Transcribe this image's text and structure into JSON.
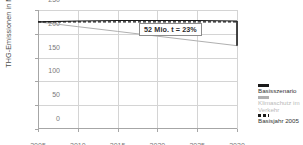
{
  "chart_data": {
    "type": "line",
    "title": "",
    "xlabel": "",
    "ylabel": "THG-Emissionen in Mio. t/a",
    "xlim": [
      2005,
      2030
    ],
    "ylim": [
      0,
      250
    ],
    "yticks": [
      0,
      50,
      100,
      150,
      200,
      250
    ],
    "xticks": [
      2005,
      2010,
      2015,
      2020,
      2025,
      2030
    ],
    "grid": true,
    "legend_position": "right",
    "x": [
      2005,
      2010,
      2015,
      2020,
      2025,
      2030
    ],
    "series": [
      {
        "name": "Basisszenario",
        "style": "solid",
        "color": "#1a1a1a",
        "values": [
          225,
          227,
          228,
          228,
          228,
          227
        ]
      },
      {
        "name": "Klimaschutz im Verkehr",
        "style": "solid",
        "color": "#b0b0b0",
        "values": [
          225,
          215,
          205,
          195,
          185,
          175
        ]
      },
      {
        "name": "Basisjahr 2005",
        "style": "dashed",
        "color": "#1a1a1a",
        "values": [
          225,
          225,
          225,
          225,
          225,
          225
        ]
      }
    ],
    "annotations": [
      {
        "text": "52 Mio. t = 23%",
        "x": 2030,
        "y_from": 175,
        "y_to": 227,
        "kind": "bracket-label"
      }
    ]
  },
  "axis": {
    "y_title": "THG-Emissionen in Mio. t/a",
    "y_tick_labels": [
      "250",
      "200",
      "150",
      "100",
      "50",
      "0"
    ],
    "x_tick_labels": [
      "2005",
      "2010",
      "2015",
      "2020",
      "2025",
      "2030"
    ]
  },
  "annotation": {
    "delta_label": "52 Mio. t = 23%"
  },
  "legend": {
    "items": [
      {
        "label": "Basisszenario",
        "label_line2": "",
        "marker": "solid-dark-line-icon"
      },
      {
        "label": "Klimaschutz im",
        "label_line2": "Verkehr",
        "marker": "solid-light-line-icon"
      },
      {
        "label": "Basisjahr 2005",
        "label_line2": "",
        "marker": "dashed-line-icon"
      }
    ]
  },
  "colors": {
    "basisszenario": "#1a1a1a",
    "klimaschutz": "#b0b0b0",
    "basisjahr": "#1a1a1a",
    "grid": "#d4d4d4",
    "axis": "#a6a6a6"
  }
}
